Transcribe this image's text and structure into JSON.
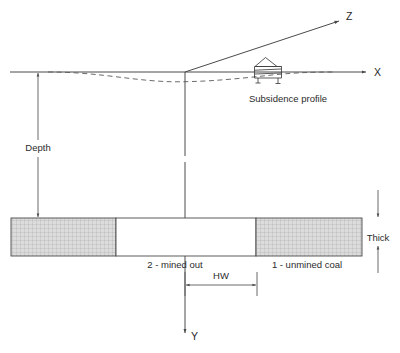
{
  "diagram": {
    "axes": {
      "x_label": "X",
      "y_label": "Y",
      "z_label": "Z"
    },
    "annotations": {
      "depth_label": "Depth",
      "thickness_label": "Thick",
      "panel_width_label": "HW",
      "subsidence_label": "Subsidence profile",
      "mined_out_label": "2 - mined out",
      "unmined_coal_label": "1 - unmined coal"
    },
    "icons": {
      "house": "house-on-stilts-icon",
      "x_axis_arrow": "arrow-right-icon",
      "y_axis_arrow": "arrow-down-icon",
      "z_axis_arrow": "arrow-up-right-icon",
      "depth_arrow": "double-arrow-vertical-icon",
      "thickness_arrows": "double-arrow-vertical-icon",
      "hw_arrow": "double-arrow-horizontal-icon"
    },
    "colors": {
      "line": "#4a4a4a",
      "text": "#2b2b2b",
      "coal_fill": "#d9d9d9",
      "coal_hatch": "#b3b3b3",
      "mined_fill": "#ffffff",
      "background": "#ffffff"
    },
    "geometry": {
      "origin_x": 185,
      "surface_y": 72,
      "seam_top_y": 218,
      "seam_bottom_y": 256,
      "seam_left_x": 11,
      "seam_right_x": 362,
      "mined_left_x": 116,
      "mined_right_x": 256
    }
  }
}
